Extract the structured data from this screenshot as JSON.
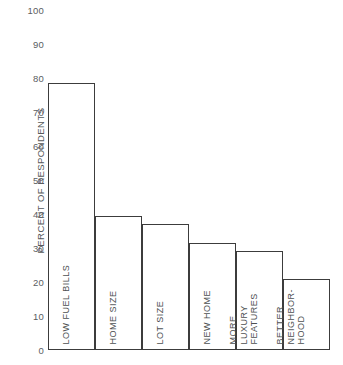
{
  "chart_data": {
    "type": "bar",
    "title": "",
    "subtitle": "",
    "xlabel": "",
    "ylabel": "PERCENT OF RESPONDENTS",
    "ylim": [
      0,
      100
    ],
    "ytick_step": 10,
    "grid": false,
    "legend": null,
    "orientation": "vertical",
    "categories": [
      "LOW FUEL BILLS",
      "HOME SIZE",
      "LOT SIZE",
      "NEW HOME",
      "MORE LUXURY FEATURES",
      "BETTER NEIGHBOR-HOOD"
    ],
    "values": [
      78.5,
      39.5,
      37,
      31.5,
      29,
      21
    ],
    "ytick_labels": [
      "100",
      "90",
      "80",
      "70",
      "60",
      "50",
      "40",
      "30",
      "20",
      "10",
      "0"
    ],
    "ytick_values": [
      100,
      90,
      80,
      70,
      60,
      50,
      40,
      30,
      20,
      10,
      0
    ]
  },
  "bars": [
    {
      "label": "LOW FUEL BILLS",
      "value": 78.5,
      "lines": [
        "LOW FUEL BILLS"
      ]
    },
    {
      "label": "HOME SIZE",
      "value": 39.5,
      "lines": [
        "HOME SIZE"
      ]
    },
    {
      "label": "LOT SIZE",
      "value": 37,
      "lines": [
        "LOT SIZE"
      ]
    },
    {
      "label": "NEW HOME",
      "value": 31.5,
      "lines": [
        "NEW HOME"
      ]
    },
    {
      "label": "MORE LUXURY FEATURES",
      "value": 29,
      "lines": [
        "MORE",
        "LUXURY",
        "FEATURES"
      ]
    },
    {
      "label": "BETTER NEIGHBOR-HOOD",
      "value": 21,
      "lines": [
        "BETTER",
        "NEIGHBOR-",
        "HOOD"
      ]
    }
  ],
  "colors": {
    "background": "#ffffff",
    "bar_outline": "#3c3c3c",
    "bar_fill": "#ffffff",
    "text": "#4d5052",
    "axis": "#3c3c3c"
  }
}
